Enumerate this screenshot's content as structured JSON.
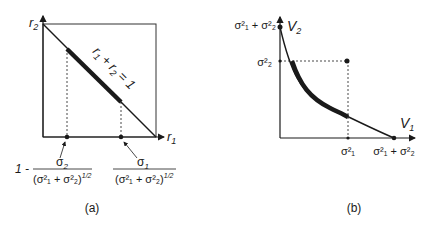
{
  "panel_a": {
    "caption": "(a)",
    "y_axis_label": {
      "base": "r",
      "sub": "2"
    },
    "x_axis_label": {
      "base": "r",
      "sub": "1"
    },
    "line_label": {
      "r1": "r",
      "r1_sub": "1",
      "plus": "+",
      "r2": "r",
      "r2_sub": "2",
      "eq": "= 1"
    },
    "left_marker_label": {
      "prefix": "1 -",
      "numerator": "σ",
      "numerator_sub": "2",
      "denominator": "(σ²₁ + σ²₂)",
      "exponent": "1/2"
    },
    "right_marker_label": {
      "numerator": "σ",
      "numerator_sub": "1",
      "denominator": "(σ²₁ + σ²₂)",
      "exponent": "1/2"
    }
  },
  "panel_b": {
    "caption": "(b)",
    "y_axis_label": {
      "base": "V",
      "sub": "2"
    },
    "x_axis_label": {
      "base": "V",
      "sub": "1"
    },
    "y_top_tick": "σ²₁ + σ²₂",
    "y_mid_tick": "σ²₂",
    "x_mid_tick": "σ²₁",
    "x_end_tick": "σ²₁ + σ²₂"
  },
  "colors": {
    "ink": "#1a1a1a",
    "background": "#ffffff"
  }
}
